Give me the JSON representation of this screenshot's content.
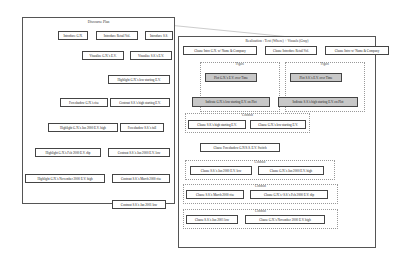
{
  "left_panel": {
    "title": "Discourse Plan",
    "nodes": [
      {
        "id": "l1",
        "label": "Introduce G.N."
      },
      {
        "id": "l2",
        "label": "Introduce Retail Vol."
      },
      {
        "id": "l3",
        "label": "Introduce S.S."
      },
      {
        "id": "l4",
        "label": "Visualize G.N.'s E.V."
      },
      {
        "id": "l5",
        "label": "Visualize S.S.'s E.V."
      },
      {
        "id": "l6",
        "label": "Highlight G.N.'s low starting E.V."
      },
      {
        "id": "l7",
        "label": "Foreshadow G.N.'s rise"
      },
      {
        "id": "l8",
        "label": "Contrast S.S.'s high starting E.V."
      },
      {
        "id": "l9",
        "label": "Highlight G.N.'s Jan 2000 E.V. high"
      },
      {
        "id": "l10",
        "label": "Foreshadow S.S.'s fall"
      },
      {
        "id": "l11",
        "label": "Highlight G.N.'s Feb 2000 E.V. dip"
      },
      {
        "id": "l12",
        "label": "Contrast S.S.'s Jan 2000 E.V. low"
      },
      {
        "id": "l13",
        "label": "Highlight G.N.'s November 2000 E.V. high"
      },
      {
        "id": "l14",
        "label": "Contrast S.S.'s March 2000 rise"
      },
      {
        "id": "l15",
        "label": "Contrast S.S.'s Jan 2001 low"
      }
    ]
  },
  "right_panel": {
    "title": "Realization : Text (Where) + Visuals (Gray)",
    "clusters": [
      {
        "id": "c1",
        "label": "Figure"
      },
      {
        "id": "c2",
        "label": "Figure"
      },
      {
        "id": "c3",
        "label": "Contrast"
      },
      {
        "id": "c4",
        "label": "Contrast"
      },
      {
        "id": "c5",
        "label": "Contrast"
      },
      {
        "id": "c6",
        "label": "Contrast"
      }
    ],
    "nodes": [
      {
        "id": "r1",
        "label": "Clause Intro G.N. w/ Name & Company"
      },
      {
        "id": "r2",
        "label": "Clause Introduce Retail Vol."
      },
      {
        "id": "r3",
        "label": "Clause Intro w/ Name & Company"
      },
      {
        "id": "r4",
        "label": "Plot G.N.'s E.V. over Time",
        "visual": true
      },
      {
        "id": "r5",
        "label": "Plot S.S.'s E.V. over Time",
        "visual": true
      },
      {
        "id": "r6",
        "label": "Indicate G.N.'s low starting E.V. on Plot",
        "visual": true
      },
      {
        "id": "r7",
        "label": "Indicate S.S.'s high starting E.V. on Plot",
        "visual": true
      },
      {
        "id": "r8",
        "label": "Clause S.S.'s high starting E.V."
      },
      {
        "id": "r9",
        "label": "Clause G.N.'s low starting E.V."
      },
      {
        "id": "r10",
        "label": "Clause Foreshadow G.N/S.S. E.V. Switch"
      },
      {
        "id": "r11",
        "label": "Clause S.S.'s Jan 2000 E.V. low"
      },
      {
        "id": "r12",
        "label": "Clause G.N.'s Jan 2000 E.V. high"
      },
      {
        "id": "r13",
        "label": "Clause S.S.'s March 2000 rise"
      },
      {
        "id": "r14",
        "label": "Clause G.N.'s+S.S.'s Feb 2000 E.V. dip"
      },
      {
        "id": "r15",
        "label": "Clause S.S.'s Jan 2001 low"
      },
      {
        "id": "r16",
        "label": "Clause G.N.'s November 2000 E.V. high"
      }
    ]
  },
  "colors": {
    "visual_node": "#c8c8c8",
    "text_node": "#ffffff",
    "border": "#444444"
  }
}
